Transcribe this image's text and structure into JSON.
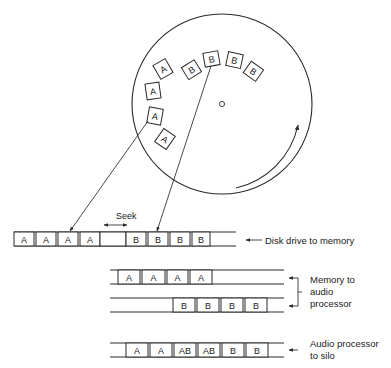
{
  "diagram": {
    "title": "",
    "disk": {
      "sectors_a": [
        "A",
        "A",
        "A",
        "A"
      ],
      "sectors_b": [
        "B",
        "B",
        "B",
        "B"
      ],
      "rotation": "clockwise"
    },
    "seek_label": "Seek",
    "rows": [
      {
        "id": "disk-to-memory",
        "label_lines": [
          "Disk drive to memory"
        ],
        "cells": [
          "A",
          "A",
          "A",
          "A",
          "",
          "B",
          "B",
          "B",
          "B"
        ]
      },
      {
        "id": "memory-to-audio-a",
        "label_lines": [
          "Memory to",
          "audio",
          "processor"
        ],
        "cells": [
          "A",
          "A",
          "A",
          "A"
        ]
      },
      {
        "id": "memory-to-audio-b",
        "label_lines": [],
        "cells": [
          "B",
          "B",
          "B",
          "B"
        ]
      },
      {
        "id": "audio-to-silo",
        "label_lines": [
          "Audio processor",
          "to silo"
        ],
        "cells": [
          "A",
          "A",
          "AB",
          "AB",
          "B",
          "B"
        ]
      }
    ],
    "colors": {
      "ink": "#2a2a2a",
      "background": "#ffffff"
    }
  }
}
